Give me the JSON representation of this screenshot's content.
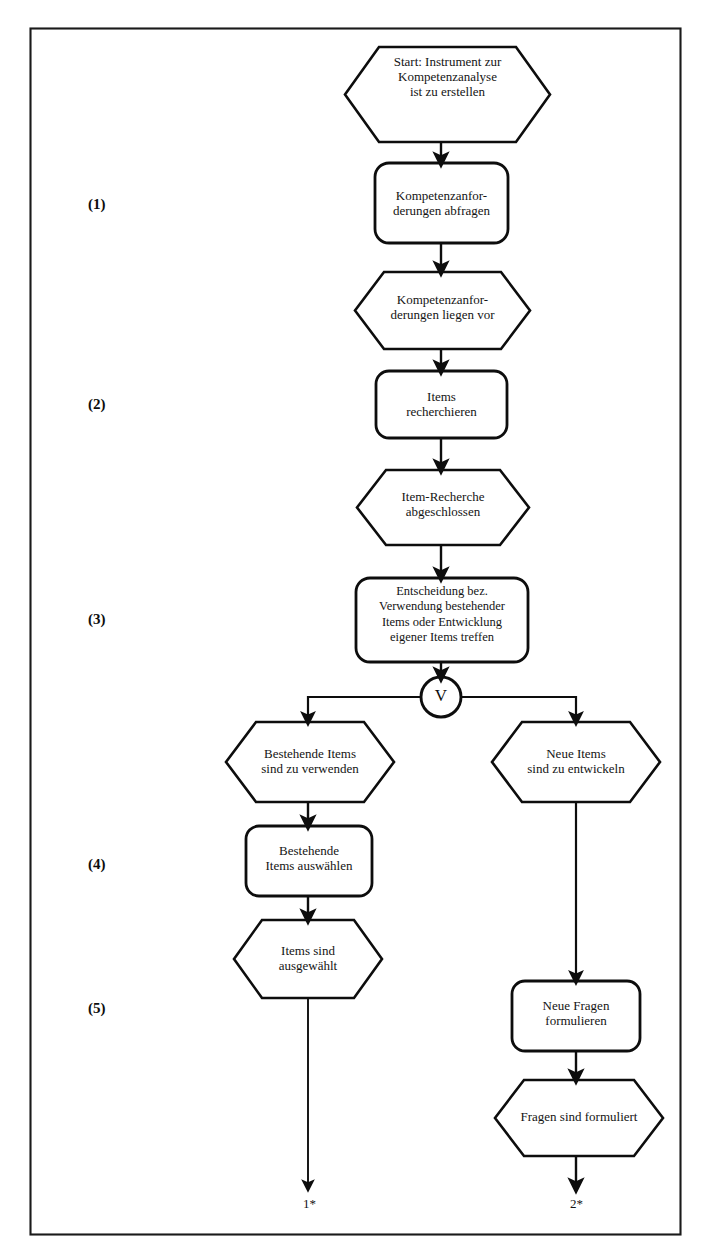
{
  "diagram": {
    "frame_color": "#1a1a1a",
    "line_color": "#0d0d0d",
    "text_color": "#141414",
    "background": "#ffffff"
  },
  "stages": [
    {
      "id": "stage-1",
      "label": "(1)",
      "x": 88,
      "y": 196
    },
    {
      "id": "stage-2",
      "label": "(2)",
      "x": 88,
      "y": 396
    },
    {
      "id": "stage-3",
      "label": "(3)",
      "x": 88,
      "y": 611
    },
    {
      "id": "stage-4",
      "label": "(4)",
      "x": 88,
      "y": 856
    },
    {
      "id": "stage-5",
      "label": "(5)",
      "x": 88,
      "y": 1000
    }
  ],
  "nodes": [
    {
      "id": "start-event",
      "type": "event",
      "shape": "hexagon",
      "text": "Start: Instrument zur\nKompetenzanalyse\nist zu erstellen",
      "font_size": 13,
      "x": 345,
      "y": 47,
      "w": 205,
      "h": 95
    },
    {
      "id": "function-kompetenzanforderungen-abfragen",
      "type": "function",
      "shape": "rounded-rect",
      "text": "Kompetenzanfor-\nderungen abfragen",
      "font_size": 13,
      "x": 375,
      "y": 163,
      "w": 133,
      "h": 80
    },
    {
      "id": "event-kompetenzanforderungen-liegen-vor",
      "type": "event",
      "shape": "hexagon",
      "text": "Kompetenzanfor-\nderungen liegen vor",
      "font_size": 13,
      "x": 355,
      "y": 272,
      "w": 175,
      "h": 77
    },
    {
      "id": "function-items-recherchieren",
      "type": "function",
      "shape": "rounded-rect",
      "text": "Items\nrecherchieren",
      "font_size": 13,
      "x": 376,
      "y": 371,
      "w": 131,
      "h": 67
    },
    {
      "id": "event-item-recherche-abgeschlossen",
      "type": "event",
      "shape": "hexagon",
      "text": "Item-Recherche\nabgeschlossen",
      "font_size": 13,
      "x": 357,
      "y": 470,
      "w": 172,
      "h": 75
    },
    {
      "id": "function-entscheidung-treffen",
      "type": "function",
      "shape": "rounded-rect",
      "text": "Entscheidung bez.\nVerwendung bestehender\nItems oder Entwicklung\neigener Items treffen",
      "font_size": 12.5,
      "x": 356,
      "y": 578,
      "w": 172,
      "h": 84
    },
    {
      "id": "event-bestehende-items-verwenden",
      "type": "event",
      "shape": "hexagon",
      "text": "Bestehende Items\nsind zu verwenden",
      "font_size": 13,
      "x": 226,
      "y": 722,
      "w": 168,
      "h": 80
    },
    {
      "id": "event-neue-items-entwickeln",
      "type": "event",
      "shape": "hexagon",
      "text": "Neue Items\nsind zu entwickeln",
      "font_size": 13,
      "x": 492,
      "y": 722,
      "w": 168,
      "h": 80
    },
    {
      "id": "function-bestehende-items-auswaehlen",
      "type": "function",
      "shape": "rounded-rect",
      "text": "Bestehende\nItems auswählen",
      "font_size": 13,
      "x": 246,
      "y": 826,
      "w": 126,
      "h": 70
    },
    {
      "id": "event-items-sind-ausgewaehlt",
      "type": "event",
      "shape": "hexagon",
      "text": "Items sind\nausgewählt",
      "font_size": 13,
      "x": 234,
      "y": 920,
      "w": 148,
      "h": 78
    },
    {
      "id": "function-neue-fragen-formulieren",
      "type": "function",
      "shape": "rounded-rect",
      "text": "Neue Fragen\nformulieren",
      "font_size": 13,
      "x": 512,
      "y": 981,
      "w": 128,
      "h": 70
    },
    {
      "id": "event-fragen-sind-formuliert",
      "type": "event",
      "shape": "hexagon",
      "text": "Fragen sind formuliert",
      "font_size": 13,
      "x": 495,
      "y": 1080,
      "w": 168,
      "h": 76
    }
  ],
  "connector": {
    "id": "xor-connector-v",
    "label": "V",
    "type": "logical-or",
    "cx": 441,
    "cy": 697,
    "r": 20
  },
  "exits": [
    {
      "id": "exit-1",
      "label": "1*",
      "x": 303,
      "y": 1196
    },
    {
      "id": "exit-2",
      "label": "2*",
      "x": 570,
      "y": 1196
    }
  ],
  "edges": [
    {
      "from": "start-event",
      "to": "function-kompetenzanforderungen-abfragen"
    },
    {
      "from": "function-kompetenzanforderungen-abfragen",
      "to": "event-kompetenzanforderungen-liegen-vor"
    },
    {
      "from": "event-kompetenzanforderungen-liegen-vor",
      "to": "function-items-recherchieren"
    },
    {
      "from": "function-items-recherchieren",
      "to": "event-item-recherche-abgeschlossen"
    },
    {
      "from": "event-item-recherche-abgeschlossen",
      "to": "function-entscheidung-treffen"
    },
    {
      "from": "function-entscheidung-treffen",
      "to": "xor-connector-v"
    },
    {
      "from": "xor-connector-v",
      "to": "event-bestehende-items-verwenden"
    },
    {
      "from": "xor-connector-v",
      "to": "event-neue-items-entwickeln"
    },
    {
      "from": "event-bestehende-items-verwenden",
      "to": "function-bestehende-items-auswaehlen"
    },
    {
      "from": "function-bestehende-items-auswaehlen",
      "to": "event-items-sind-ausgewaehlt"
    },
    {
      "from": "event-items-sind-ausgewaehlt",
      "to": "exit-1"
    },
    {
      "from": "event-neue-items-entwickeln",
      "to": "function-neue-fragen-formulieren"
    },
    {
      "from": "function-neue-fragen-formulieren",
      "to": "event-fragen-sind-formuliert"
    },
    {
      "from": "event-fragen-sind-formuliert",
      "to": "exit-2"
    }
  ],
  "frame": {
    "x": 30,
    "y": 28,
    "w": 651,
    "h": 1207
  }
}
